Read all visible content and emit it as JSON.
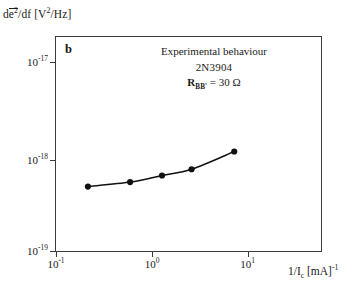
{
  "chart_data": {
    "type": "line",
    "title": "",
    "panel_label": "b",
    "xlabel": "1/I_c [mA]^-1",
    "ylabel": "de^2/df [V^2/Hz]",
    "xscale": "log",
    "yscale": "log",
    "xlim": [
      0.1,
      31.6
    ],
    "ylim": [
      1e-19,
      2.1e-17
    ],
    "grid": false,
    "legend": "none",
    "marker": "filled-circle",
    "x": [
      0.2,
      0.5,
      1.0,
      1.9,
      4.8
    ],
    "values": [
      5e-19,
      5.6e-19,
      6.6e-19,
      7.7e-19,
      1.2e-18
    ],
    "series": [
      {
        "name": "Experimental behaviour 2N3904",
        "x": [
          0.2,
          0.5,
          1.0,
          1.9,
          4.8
        ],
        "values": [
          5e-19,
          5.6e-19,
          6.6e-19,
          7.7e-19,
          1.2e-18
        ]
      }
    ],
    "xticks": [
      0.1,
      1,
      10
    ],
    "xticklabels": [
      "10-1",
      "100",
      "101"
    ],
    "yticks": [
      1e-19,
      1e-18,
      1e-17
    ],
    "yticklabels": [
      "10-19",
      "10-18",
      "10-17"
    ],
    "annotations": [
      "Experimental behaviour",
      "2N3904",
      "RBB' = 30 Ohm"
    ]
  },
  "axes": {
    "ylabel": {
      "prefix": "d",
      "overline_base": "e",
      "overline_sup": "2",
      "middle": "/df  [V",
      "sup2": "2",
      "suffix": "/Hz]"
    },
    "xlabel": {
      "prefix": "1/I",
      "sub": "c",
      "middle": "  [mA]",
      "sup": "-1"
    },
    "yticks": [
      {
        "mantissa": "10",
        "exponent": "-17"
      },
      {
        "mantissa": "10",
        "exponent": "-18"
      },
      {
        "mantissa": "10",
        "exponent": "-19"
      }
    ],
    "xticks": [
      {
        "mantissa": "10",
        "exponent": "-1"
      },
      {
        "mantissa": "10",
        "exponent": "0"
      },
      {
        "mantissa": "10",
        "exponent": "1"
      }
    ]
  },
  "panel": {
    "letter": "b"
  },
  "annotation": {
    "line1": "Experimental behaviour",
    "line2": "2N3904",
    "line3_prefix": "R",
    "line3_sub": "BB'",
    "line3_suffix": " = 30 Ω"
  },
  "style": {
    "frame_color": "#3b3b3b",
    "curve_color": "#111111",
    "marker_color": "#111111",
    "background": "#ffffff"
  }
}
